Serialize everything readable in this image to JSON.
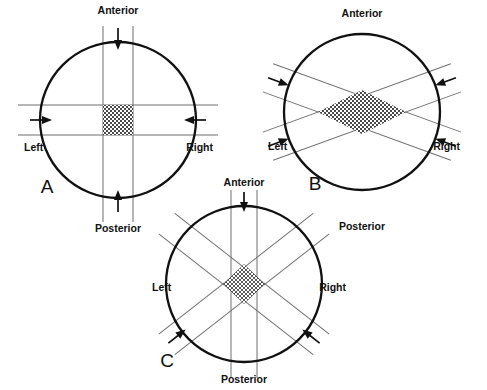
{
  "figure": {
    "type": "diagram",
    "background_color": "#ffffff",
    "outline_color": "#111111",
    "beam_color": "#6f6f6f",
    "target_fill": "hatched"
  },
  "panels": [
    {
      "id": "A",
      "letter": "A",
      "arrangement": "orthogonal-two-field",
      "center": {
        "x": 118,
        "y": 120
      },
      "radius": 78,
      "beams": [
        {
          "name": "anterior-posterior-beam",
          "orientation": "vertical",
          "angle_deg": 90,
          "half_width": 15
        },
        {
          "name": "left-right-beam",
          "orientation": "horizontal",
          "angle_deg": 0,
          "half_width": 15
        }
      ],
      "labels": {
        "anterior": "Anterior",
        "posterior": "Posterior",
        "left": "Left",
        "right": "Right"
      },
      "label_positions": {
        "anterior": {
          "x": 118,
          "y": 14
        },
        "posterior": {
          "x": 118,
          "y": 232
        },
        "left": {
          "x": 24,
          "y": 148
        },
        "right": {
          "x": 207,
          "y": 148
        },
        "letter": {
          "x": 47,
          "y": 193
        }
      },
      "arrows": [
        {
          "name": "anterior-arrow",
          "direction": "down",
          "angle_deg": 90
        },
        {
          "name": "posterior-arrow",
          "direction": "up",
          "angle_deg": 270
        },
        {
          "name": "left-arrow",
          "direction": "right",
          "angle_deg": 0
        },
        {
          "name": "right-arrow",
          "direction": "left",
          "angle_deg": 180
        }
      ]
    },
    {
      "id": "B",
      "letter": "B",
      "arrangement": "oblique-two-field",
      "center": {
        "x": 362,
        "y": 112
      },
      "radius": 78,
      "beams": [
        {
          "name": "right-anterior-oblique-beam",
          "orientation": "diagonal",
          "angle_deg": 20,
          "half_width": 15
        },
        {
          "name": "left-anterior-oblique-beam",
          "orientation": "diagonal",
          "angle_deg": -20,
          "half_width": 15
        }
      ],
      "labels": {
        "anterior": "Anterior",
        "posterior": "Posterior",
        "left": "Left",
        "right": "Right"
      },
      "label_positions": {
        "anterior": {
          "x": 362,
          "y": 17
        },
        "posterior": {
          "x": 362,
          "y": 230
        },
        "left": {
          "x": 268,
          "y": 147
        },
        "right": {
          "x": 452,
          "y": 147
        },
        "letter": {
          "x": 315,
          "y": 190
        }
      },
      "arrows": [
        {
          "name": "left-upper-oblique-arrow",
          "direction": "down-right",
          "angle_deg": 20
        },
        {
          "name": "right-upper-oblique-arrow",
          "direction": "down-left",
          "angle_deg": 160
        },
        {
          "name": "left-lower-oblique-arrow",
          "direction": "up-right",
          "angle_deg": -20
        },
        {
          "name": "right-lower-oblique-arrow",
          "direction": "up-left",
          "angle_deg": 200
        }
      ]
    },
    {
      "id": "C",
      "letter": "C",
      "arrangement": "four-field",
      "center": {
        "x": 244,
        "y": 284
      },
      "radius": 78,
      "beams": [
        {
          "name": "anterior-posterior-beam",
          "orientation": "vertical",
          "angle_deg": 90,
          "half_width": 13
        },
        {
          "name": "right-anterior-oblique-beam",
          "orientation": "diagonal",
          "angle_deg": 38,
          "half_width": 13
        },
        {
          "name": "left-anterior-oblique-beam",
          "orientation": "diagonal",
          "angle_deg": -38,
          "half_width": 13
        }
      ],
      "labels": {
        "anterior": "Anterior",
        "posterior": "Posterior",
        "left": "Left",
        "right": "Right"
      },
      "label_positions": {
        "anterior": {
          "x": 244,
          "y": 186
        },
        "posterior": {
          "x": 244,
          "y": 381
        },
        "left": {
          "x": 156,
          "y": 288
        },
        "right": {
          "x": 340,
          "y": 288
        },
        "letter": {
          "x": 167,
          "y": 367
        }
      },
      "arrows": [
        {
          "name": "anterior-arrow",
          "direction": "down",
          "angle_deg": 90
        },
        {
          "name": "left-lower-oblique-arrow",
          "direction": "up-right",
          "angle_deg": -38
        },
        {
          "name": "right-lower-oblique-arrow",
          "direction": "up-left",
          "angle_deg": 218
        }
      ]
    }
  ]
}
